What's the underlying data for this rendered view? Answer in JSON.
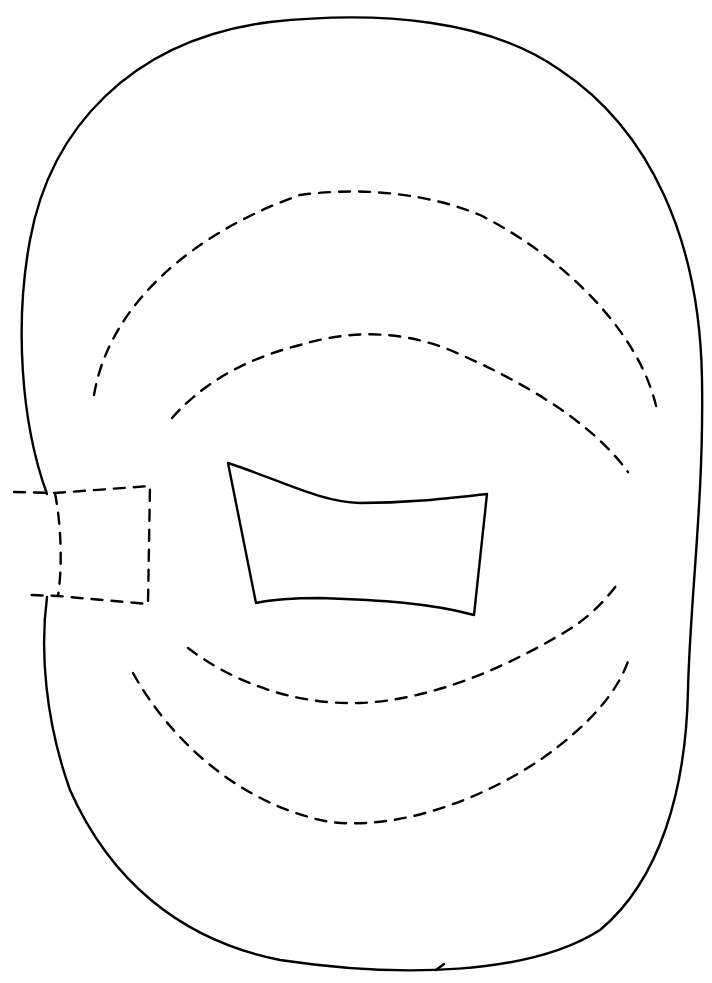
{
  "diagram": {
    "type": "line-drawing",
    "background": "#ffffff",
    "stroke_color": "#000000",
    "elements": [
      {
        "name": "outer-outline",
        "style": "solid",
        "shape": "rounded-blob"
      },
      {
        "name": "inner-window",
        "style": "solid",
        "shape": "trapezoid"
      },
      {
        "name": "side-tab",
        "style": "dashed",
        "shape": "rectangle"
      },
      {
        "name": "upper-arc-outer",
        "style": "dashed"
      },
      {
        "name": "upper-arc-inner",
        "style": "dashed"
      },
      {
        "name": "lower-arc-inner",
        "style": "dashed"
      },
      {
        "name": "lower-arc-outer",
        "style": "dashed"
      }
    ],
    "text_labels": []
  }
}
